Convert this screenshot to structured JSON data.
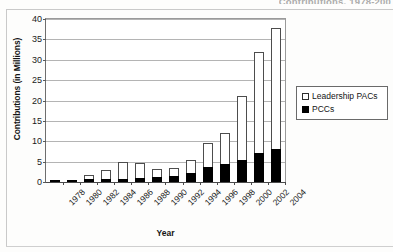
{
  "page": {
    "cropped_header_text": "Contributions, 1978-200"
  },
  "legend": {
    "position": "right",
    "entries": [
      {
        "label": "Leadership PACs",
        "swatch": "open-square-icon",
        "color": "#ffffff"
      },
      {
        "label": "PCCs",
        "swatch": "filled-square-icon",
        "color": "#000000"
      }
    ]
  },
  "chart_data": {
    "type": "bar",
    "stacked": true,
    "title": "",
    "xlabel": "Year",
    "ylabel": "Contributions (in Millions)",
    "ylim": [
      0,
      40
    ],
    "ytick_step": 5,
    "yticks": [
      0,
      5,
      10,
      15,
      20,
      25,
      30,
      35,
      40
    ],
    "ytick_labels": [
      "0",
      "5",
      "10",
      "15",
      "20",
      "25",
      "30",
      "35",
      "40"
    ],
    "grid": true,
    "grid_axis": "y",
    "legend_position": "right",
    "categories": [
      "1978",
      "1980",
      "1982",
      "1984",
      "1986",
      "1988",
      "1990",
      "1992",
      "1994",
      "1996",
      "1998",
      "2000",
      "2002",
      "2004"
    ],
    "series": [
      {
        "name": "PCCs",
        "color": "#000000",
        "values": [
          0.2,
          0.1,
          0.8,
          0.8,
          0.8,
          1.0,
          1.3,
          1.4,
          2.1,
          3.7,
          4.3,
          5.4,
          7.1,
          8.0
        ]
      },
      {
        "name": "Leadership PACs",
        "color": "#ffffff",
        "values": [
          0.0,
          0.0,
          1.0,
          2.1,
          4.0,
          3.6,
          1.8,
          2.0,
          3.3,
          6.0,
          7.8,
          15.6,
          24.9,
          29.9
        ]
      }
    ],
    "totals": [
      0.2,
      0.1,
      1.8,
      2.9,
      4.8,
      4.6,
      3.1,
      3.4,
      5.4,
      9.7,
      12.1,
      21.0,
      32.0,
      37.9
    ]
  }
}
